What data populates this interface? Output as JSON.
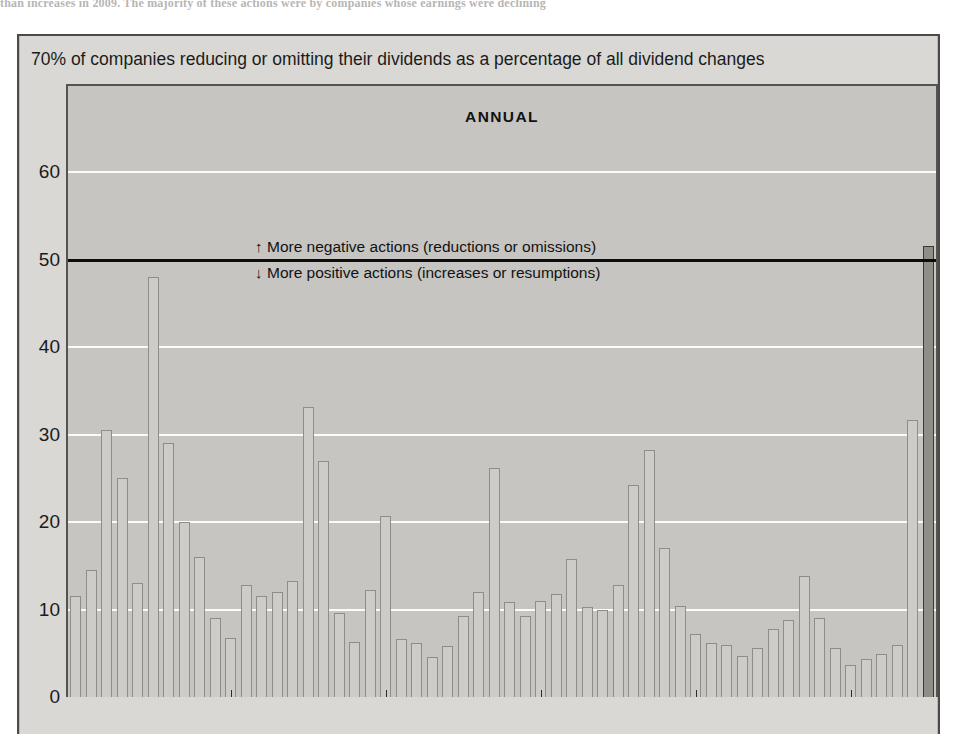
{
  "page": {
    "cut_off_top_line": "than increases in 2009. The majority of these actions were by companies whose earnings were declining"
  },
  "figure": {
    "caption": "70% of companies reducing or omitting their dividends as a percentage of all dividend changes",
    "title": "ANNUAL",
    "annotation_up": "More negative actions (reductions or omissions)",
    "annotation_down": "More positive actions (increases or resumptions)",
    "arrow_up": "↑",
    "arrow_down": "↓",
    "reference_value": 50
  },
  "colors": {
    "panel_bg": "#d9d8d4",
    "plot_bg": "#c6c5c1",
    "bar_fill": "#cdccc8",
    "bar_stroke": "#8e8d88",
    "highlight_fill": "#8e8d88",
    "highlight_stroke": "#3b3a37",
    "gridline": "#fbfbfa",
    "reference_line": "#0c0c0c",
    "text": "#1b1b1b"
  },
  "chart_data": {
    "type": "bar",
    "title": "ANNUAL",
    "subtitle": "70% of companies reducing or omitting their dividends as a percentage of all dividend changes",
    "xlabel": "",
    "ylabel": "",
    "ylim": [
      0,
      65
    ],
    "grid": true,
    "legend": false,
    "yticks": [
      0,
      10,
      20,
      30,
      40,
      50,
      60
    ],
    "ytick_labels": [
      "0",
      "10",
      "20",
      "30",
      "40",
      "50",
      "60"
    ],
    "reference_line": {
      "value": 50,
      "label_above": "More negative actions (reductions or omissions)",
      "label_below": "More positive actions (increases or resumptions)"
    },
    "series_name": "Companies reducing or omitting dividends (% of all dividend changes)",
    "values": [
      11.5,
      14.5,
      30.5,
      25.0,
      13.0,
      48.0,
      29.0,
      20.0,
      16.0,
      9.0,
      6.8,
      12.8,
      11.5,
      12.0,
      13.3,
      33.2,
      27.0,
      9.6,
      6.3,
      12.2,
      20.7,
      6.6,
      6.2,
      4.6,
      5.8,
      9.3,
      12.0,
      26.2,
      10.9,
      9.3,
      11.0,
      11.8,
      15.8,
      10.3,
      10.0,
      12.8,
      24.2,
      28.2,
      17.0,
      10.4,
      7.2,
      6.2,
      6.0,
      4.7,
      5.6,
      7.8,
      8.8,
      13.8,
      9.0,
      5.6,
      3.7,
      4.4,
      4.9,
      6.0,
      31.7,
      51.5
    ],
    "highlighted_index": 55,
    "highlight_note": "final bar shaded dark, just above the 50% reference line"
  }
}
